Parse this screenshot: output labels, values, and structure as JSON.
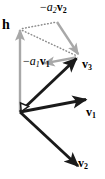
{
  "figure": {
    "kind": "vector-decomposition-diagram",
    "width": 105,
    "height": 179,
    "background_color": "#ffffff",
    "colors": {
      "vector_black": "#1a1a1a",
      "vector_gray": "#a8a8a8",
      "dotted_gray": "#8c8c8c",
      "right_angle_marker": "#1a1a1a"
    }
  },
  "labels": {
    "h": "h",
    "minus_a2_v2": {
      "minus": "−",
      "coefficient": "a",
      "coefficient_sub": "2",
      "vector": "v",
      "vector_sub": "2"
    },
    "minus_a1_v1": {
      "minus": "−",
      "coefficient": "a",
      "coefficient_sub": "1",
      "vector": "v",
      "vector_sub": "1"
    },
    "v3": {
      "vector": "v",
      "vector_sub": "3"
    },
    "v1": {
      "vector": "v",
      "vector_sub": "1"
    },
    "v2": {
      "vector": "v",
      "vector_sub": "2"
    }
  },
  "geometry": {
    "origin": {
      "x": 20,
      "y": 112
    },
    "vectors": [
      {
        "name": "v1",
        "from": [
          20,
          112
        ],
        "to": [
          88,
          99
        ],
        "style": "solid-black-arrow"
      },
      {
        "name": "v2",
        "from": [
          20,
          112
        ],
        "to": [
          80,
          168
        ],
        "style": "solid-black-arrow"
      },
      {
        "name": "v3",
        "from": [
          20,
          112
        ],
        "to": [
          78,
          57
        ],
        "style": "solid-black-arrow"
      },
      {
        "name": "h",
        "from": [
          20,
          112
        ],
        "to": [
          20,
          28
        ],
        "style": "solid-gray-arrow"
      },
      {
        "name": "minus_a2_v2",
        "from": [
          57,
          22
        ],
        "to": [
          79,
          55
        ],
        "style": "solid-gray-arrow"
      },
      {
        "name": "minus_a1_v1",
        "from": [
          76,
          58
        ],
        "to": [
          43,
          64
        ],
        "style": "solid-gray-arrow"
      }
    ],
    "dotted_lines": [
      {
        "from": [
          22,
          28
        ],
        "to": [
          57,
          22
        ]
      },
      {
        "from": [
          22,
          30
        ],
        "to": [
          78,
          56
        ]
      }
    ],
    "right_angle_marker": {
      "at": [
        20,
        112
      ],
      "size": 9
    }
  }
}
